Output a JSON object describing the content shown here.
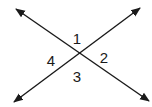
{
  "figure": {
    "type": "intersecting-lines",
    "line_color": "#1a1a1a",
    "intersection": [
      81,
      54
    ],
    "lines": [
      {
        "name": "line-a",
        "from": [
          16,
          9
        ],
        "to": [
          149,
          101
        ]
      },
      {
        "name": "line-b",
        "from": [
          14,
          102
        ],
        "to": [
          140,
          8
        ]
      }
    ],
    "angles": [
      {
        "label": "1",
        "x": 77,
        "y": 38
      },
      {
        "label": "2",
        "x": 104,
        "y": 57
      },
      {
        "label": "3",
        "x": 77,
        "y": 76
      },
      {
        "label": "4",
        "x": 51,
        "y": 60
      }
    ]
  }
}
